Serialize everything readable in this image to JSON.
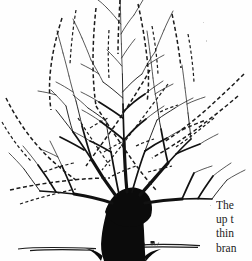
{
  "figure": {
    "kind": "line-illustration",
    "medium": "black ink on white paper, scanned book page",
    "legend": {
      "solid_lines": "branches retained on the tree",
      "dashed_lines": "branches marked for removal"
    },
    "colors": {
      "ink": "#111111",
      "trunk_fill": "#0b0b0b",
      "paper": "#fefefe",
      "text": "#1b1b1b"
    }
  },
  "caption": {
    "clipped": true,
    "lines": [
      "The",
      "up t",
      "thin",
      "bran"
    ]
  },
  "elements": {
    "trunk_label": "trunk",
    "scaffold_label": "scaffold-branches",
    "ground_label": "ground-line",
    "removal_label": "branches-to-remove"
  }
}
